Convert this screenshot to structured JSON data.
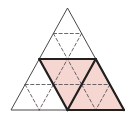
{
  "figure": {
    "type": "geometric-diagram",
    "canvas": {
      "width": 133,
      "height": 122,
      "background": "#ffffff"
    },
    "colors": {
      "shade_fill": "#f5d6d1",
      "outline_bold": "#221f1f",
      "outline_thin": "#4a4648",
      "dashed": "#5a5558",
      "background": "#ffffff"
    },
    "stroke_widths": {
      "bold": 2.2,
      "thin": 1.0,
      "dashed": 0.9
    },
    "dash_pattern": "3.2,2.4",
    "outer_triangle": {
      "name": "outer-equilateral-triangle",
      "apex": {
        "x": 67.5,
        "y": 8
      },
      "bottom_left": {
        "x": 11,
        "y": 110
      },
      "bottom_right": {
        "x": 124,
        "y": 110
      },
      "side_midpoints": {
        "left_mid": {
          "x": 39.25,
          "y": 59
        },
        "right_mid": {
          "x": 95.75,
          "y": 59
        },
        "bottom_mid": {
          "x": 67.5,
          "y": 110
        }
      }
    },
    "subdivision": {
      "level_1_count": 4,
      "level_2_count": 16,
      "description": "Each of the four medial sub-triangles is further divided into four by dashed midlines."
    },
    "sub_triangles": [
      {
        "id": "top",
        "orientation": "up",
        "shaded": false,
        "points": "67.5,8 39.25,59 95.75,59"
      },
      {
        "id": "bottom-left",
        "orientation": "up",
        "shaded": false,
        "points": "39.25,59 11,110 67.5,110"
      },
      {
        "id": "bottom-right",
        "orientation": "up",
        "shaded": true,
        "points": "95.75,59 67.5,110 124,110"
      },
      {
        "id": "center-inverted",
        "orientation": "down",
        "shaded": true,
        "points": "39.25,59 95.75,59 67.5,110"
      }
    ],
    "shaded_region": {
      "name": "shaded-rhombus-region",
      "fill": "#f5d6d1",
      "outline": "#221f1f",
      "outline_points": "39.25,59 95.75,59 124,110 67.5,110",
      "area_fraction_of_whole": "2/4"
    },
    "solid_thin_lines": [
      {
        "id": "medial-left",
        "x1": 39.25,
        "y1": 59,
        "x2": 67.5,
        "y2": 110
      },
      {
        "id": "medial-right",
        "x1": 95.75,
        "y1": 59,
        "x2": 67.5,
        "y2": 110
      },
      {
        "id": "medial-horizontal",
        "x1": 39.25,
        "y1": 59,
        "x2": 95.75,
        "y2": 59
      }
    ],
    "dashed_lines": [
      {
        "id": "top-tri-horizontal",
        "x1": 53.4,
        "y1": 33.5,
        "x2": 81.6,
        "y2": 33.5
      },
      {
        "id": "top-tri-left",
        "x1": 53.4,
        "y1": 33.5,
        "x2": 67.5,
        "y2": 59
      },
      {
        "id": "top-tri-right",
        "x1": 81.6,
        "y1": 33.5,
        "x2": 67.5,
        "y2": 59
      },
      {
        "id": "bl-tri-horizontal",
        "x1": 25.1,
        "y1": 84.5,
        "x2": 53.4,
        "y2": 84.5
      },
      {
        "id": "bl-tri-left",
        "x1": 25.1,
        "y1": 84.5,
        "x2": 39.25,
        "y2": 110
      },
      {
        "id": "bl-tri-right",
        "x1": 53.4,
        "y1": 84.5,
        "x2": 39.25,
        "y2": 110
      },
      {
        "id": "br-tri-horizontal",
        "x1": 81.6,
        "y1": 84.5,
        "x2": 109.9,
        "y2": 84.5
      },
      {
        "id": "br-tri-left",
        "x1": 81.6,
        "y1": 84.5,
        "x2": 95.75,
        "y2": 110
      },
      {
        "id": "br-tri-right",
        "x1": 109.9,
        "y1": 84.5,
        "x2": 95.75,
        "y2": 110
      },
      {
        "id": "ct-tri-horizontal",
        "x1": 53.4,
        "y1": 84.5,
        "x2": 81.6,
        "y2": 84.5
      },
      {
        "id": "ct-tri-left",
        "x1": 53.4,
        "y1": 84.5,
        "x2": 67.5,
        "y2": 59
      },
      {
        "id": "ct-tri-right",
        "x1": 81.6,
        "y1": 84.5,
        "x2": 67.5,
        "y2": 59
      }
    ],
    "bold_outline_segments": [
      {
        "id": "shade-top-edge",
        "x1": 39.25,
        "y1": 59,
        "x2": 95.75,
        "y2": 59
      },
      {
        "id": "shade-left-edge",
        "x1": 39.25,
        "y1": 59,
        "x2": 67.5,
        "y2": 110
      },
      {
        "id": "shade-inner-edge",
        "x1": 95.75,
        "y1": 59,
        "x2": 67.5,
        "y2": 110
      },
      {
        "id": "shade-right-edge",
        "x1": 95.75,
        "y1": 59,
        "x2": 124,
        "y2": 110
      },
      {
        "id": "shade-bottom-edge",
        "x1": 67.5,
        "y1": 110,
        "x2": 124,
        "y2": 110
      }
    ]
  }
}
